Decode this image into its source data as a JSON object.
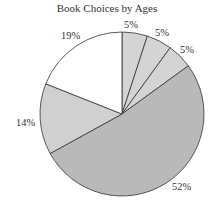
{
  "chart_data": {
    "type": "pie",
    "title": "Book Choices by Ages",
    "slices": [
      {
        "label": "5%",
        "value": 5,
        "color": "#d4d4d4"
      },
      {
        "label": "5%",
        "value": 5,
        "color": "#d4d4d4"
      },
      {
        "label": "5%",
        "value": 5,
        "color": "#d4d4d4"
      },
      {
        "label": "52%",
        "value": 52,
        "color": "#b9b9b9"
      },
      {
        "label": "14%",
        "value": 14,
        "color": "#d0d0d0"
      },
      {
        "label": "19%",
        "value": 19,
        "color": "#ffffff"
      }
    ],
    "start_angle": "12 o'clock, clockwise",
    "legend": "none"
  }
}
